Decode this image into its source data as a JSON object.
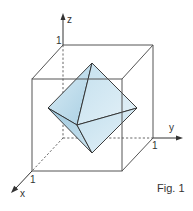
{
  "figure": {
    "caption": "Fig. 1",
    "axes": {
      "x": {
        "label": "x",
        "tick": "1"
      },
      "y": {
        "label": "y",
        "tick": "1"
      },
      "z": {
        "label": "z",
        "tick": "1"
      }
    },
    "solid": "octahedron inscribed in unit cube",
    "colors": {
      "cube_edge": "#555555",
      "face_light": "#d6e9f3",
      "face_mid": "#b9d9ea",
      "face_dark": "#9ec6dc",
      "edge": "#2a2a2a"
    }
  }
}
